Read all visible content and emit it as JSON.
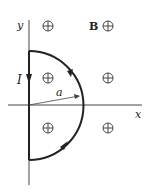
{
  "diagram": {
    "axis_labels": {
      "x": "x",
      "y": "y"
    },
    "current_label": "I",
    "radius_label": "a",
    "field_label": "B",
    "field_symbol": "into-page (⊕)",
    "field_markers_count": 6
  }
}
